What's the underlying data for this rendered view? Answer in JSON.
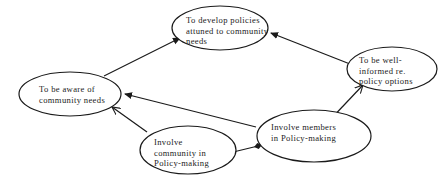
{
  "diagram": {
    "nodes": [
      {
        "id": "develop_policies",
        "lines": [
          "To develop policies",
          "attuned to community",
          "needs"
        ],
        "cx": 220,
        "cy": 28,
        "rx": 48,
        "ry": 22,
        "text_x": 186,
        "text_y": 23
      },
      {
        "id": "aware_needs",
        "lines": [
          "To be aware of",
          "community needs"
        ],
        "cx": 70,
        "cy": 94,
        "rx": 51,
        "ry": 22,
        "text_x": 39,
        "text_y": 92
      },
      {
        "id": "well_informed",
        "lines": [
          "To be well-",
          "informed re.",
          "policy options"
        ],
        "cx": 392,
        "cy": 69,
        "rx": 45,
        "ry": 22,
        "text_x": 359,
        "text_y": 63
      },
      {
        "id": "involve_community",
        "lines": [
          "Involve",
          "community in",
          "Policy-making"
        ],
        "cx": 188,
        "cy": 150,
        "rx": 48,
        "ry": 24,
        "text_x": 154,
        "text_y": 145
      },
      {
        "id": "involve_members",
        "lines": [
          "Involve members",
          "in Policy-making"
        ],
        "cx": 314,
        "cy": 136,
        "rx": 57,
        "ry": 26,
        "text_x": 271,
        "text_y": 130
      }
    ],
    "edges": [
      {
        "from": "aware_needs",
        "to": "develop_policies",
        "x1": 104,
        "y1": 76,
        "x2": 180,
        "y2": 38,
        "head": "filled"
      },
      {
        "from": "well_informed",
        "to": "develop_policies",
        "x1": 350,
        "y1": 64,
        "x2": 271,
        "y2": 33,
        "head": "filled"
      },
      {
        "from": "involve_members",
        "to": "aware_needs",
        "x1": 256,
        "y1": 127,
        "x2": 125,
        "y2": 94,
        "head": "filled"
      },
      {
        "from": "involve_members",
        "to": "well_informed",
        "x1": 328,
        "y1": 122,
        "x2": 363,
        "y2": 85,
        "head": "open"
      },
      {
        "from": "involve_community",
        "to": "aware_needs",
        "x1": 147,
        "y1": 132,
        "x2": 112,
        "y2": 107,
        "head": "open"
      },
      {
        "from": "involve_community",
        "to": "involve_members",
        "x1": 225,
        "y1": 154,
        "x2": 258,
        "y2": 146,
        "head": "diamond-both"
      }
    ],
    "colors": {
      "background": "#ffffff",
      "stroke": "#1a1a1a",
      "text": "#222222"
    }
  }
}
